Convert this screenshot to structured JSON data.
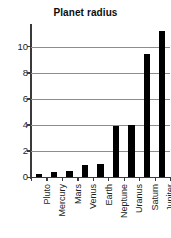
{
  "chart_data": {
    "type": "bar",
    "title": "Planet radius",
    "xlabel": "",
    "ylabel": "",
    "categories": [
      "Pluto",
      "Mercury",
      "Mars",
      "Venus",
      "Earth",
      "Neptune",
      "Uranus",
      "Saturn",
      "Jupiter"
    ],
    "values": [
      0.2,
      0.4,
      0.5,
      0.9,
      1.0,
      3.9,
      4.0,
      9.4,
      11.2
    ],
    "ylim": [
      0,
      11.5
    ],
    "yticks": [
      0,
      2,
      4,
      6,
      8,
      10
    ],
    "ytick_labels": [
      "0",
      "2",
      "4",
      "6",
      "8",
      "10"
    ],
    "grid": true,
    "legend": false,
    "bar_color": "#000000",
    "gridline_color": "#8d8d8d",
    "axis_color": "#3a3a3a",
    "background_color": "#ffffff",
    "xtick_label_rotation": 90
  }
}
